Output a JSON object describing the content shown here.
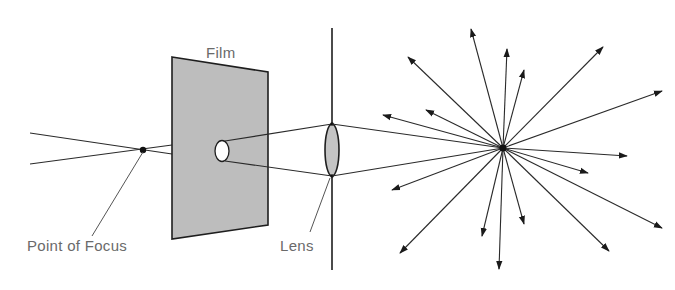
{
  "diagram": {
    "labels": {
      "film": "Film",
      "point_of_focus": "Point of Focus",
      "lens": "Lens"
    },
    "colors": {
      "line": "#2a2a2a",
      "film_fill": "#bdbdbd",
      "lens_fill": "#c4c4c4",
      "label_text": "#6a6a6a"
    },
    "geometry": {
      "focus_point": [
        143,
        150
      ],
      "film_polygon": [
        [
          172,
          57
        ],
        [
          268,
          72
        ],
        [
          268,
          225
        ],
        [
          172,
          239
        ]
      ],
      "film_hole": {
        "cx": 222,
        "cy": 151,
        "rx": 7,
        "ry": 10.5
      },
      "lens_plane_x": 332,
      "lens_plane_y": [
        28,
        270
      ],
      "lens": {
        "cx": 332,
        "cy": 150,
        "rx": 7,
        "ry": 26
      },
      "light_source": [
        503,
        148
      ],
      "arrow_tips": [
        [
          471,
          29
        ],
        [
          507,
          49
        ],
        [
          524,
          70
        ],
        [
          603,
          47
        ],
        [
          662,
          91
        ],
        [
          627,
          156
        ],
        [
          588,
          173
        ],
        [
          662,
          228
        ],
        [
          609,
          251
        ],
        [
          524,
          224
        ],
        [
          499,
          269
        ],
        [
          482,
          236
        ],
        [
          400,
          253
        ],
        [
          392,
          190
        ],
        [
          383,
          115
        ],
        [
          426,
          110
        ],
        [
          408,
          57
        ]
      ]
    }
  }
}
